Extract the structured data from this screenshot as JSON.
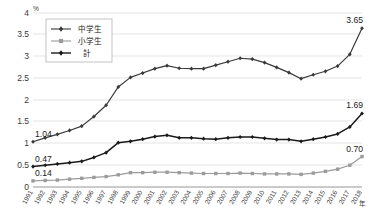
{
  "chart_data": {
    "type": "line",
    "title": "",
    "subtitle": "",
    "xlabel": "年",
    "ylabel": "%",
    "ylim": [
      0,
      4
    ],
    "ytick_values": [
      0,
      0.5,
      1,
      1.5,
      2,
      2.5,
      3,
      3.5,
      4
    ],
    "ytick_labels": [
      "0",
      "0.5",
      "1",
      "1.5",
      "2",
      "2.5",
      "3",
      "3.5",
      "4"
    ],
    "grid": true,
    "legend_position": "top-left",
    "x": [
      1991,
      1992,
      1993,
      1994,
      1995,
      1996,
      1997,
      1998,
      1999,
      2000,
      2001,
      2002,
      2003,
      2004,
      2005,
      2006,
      2007,
      2008,
      2009,
      2010,
      2011,
      2012,
      2013,
      2014,
      2015,
      2016,
      2017,
      2018
    ],
    "categories": [
      "1991",
      "1992",
      "1993",
      "1994",
      "1995",
      "1996",
      "1997",
      "1998",
      "1999",
      "2000",
      "2001",
      "2002",
      "2003",
      "2004",
      "2005",
      "2006",
      "2007",
      "2008",
      "2009",
      "2010",
      "2011",
      "2012",
      "2013",
      "2014",
      "2015",
      "2016",
      "2017",
      "2018"
    ],
    "series": [
      {
        "name": "中学生",
        "color": "#3a3a3a",
        "marker": "diamond",
        "values": [
          1.04,
          1.13,
          1.21,
          1.3,
          1.4,
          1.62,
          1.88,
          2.3,
          2.52,
          2.62,
          2.72,
          2.79,
          2.73,
          2.72,
          2.72,
          2.8,
          2.88,
          2.96,
          2.94,
          2.86,
          2.75,
          2.63,
          2.49,
          2.58,
          2.66,
          2.78,
          3.05,
          3.65
        ],
        "start_label": "1.04",
        "end_label": "3.65"
      },
      {
        "name": "小学生",
        "color": "#9b9b9b",
        "marker": "square",
        "values": [
          0.14,
          0.15,
          0.16,
          0.18,
          0.2,
          0.22,
          0.24,
          0.28,
          0.33,
          0.33,
          0.34,
          0.34,
          0.33,
          0.32,
          0.31,
          0.31,
          0.31,
          0.32,
          0.31,
          0.3,
          0.3,
          0.3,
          0.29,
          0.32,
          0.36,
          0.41,
          0.5,
          0.7
        ],
        "start_label": "0.14",
        "end_label": "0.70"
      },
      {
        "name": "計",
        "color": "#1a1a1a",
        "marker": "diamond",
        "values": [
          0.47,
          0.5,
          0.53,
          0.56,
          0.59,
          0.68,
          0.79,
          1.02,
          1.05,
          1.1,
          1.16,
          1.19,
          1.13,
          1.13,
          1.11,
          1.1,
          1.13,
          1.15,
          1.15,
          1.12,
          1.09,
          1.09,
          1.05,
          1.1,
          1.15,
          1.22,
          1.38,
          1.69
        ],
        "start_label": "0.47",
        "end_label": "1.69"
      }
    ],
    "annotations": [
      {
        "text": "1.04",
        "series": "中学生",
        "x": 1991
      },
      {
        "text": "0.47",
        "series": "計",
        "x": 1991
      },
      {
        "text": "0.14",
        "series": "小学生",
        "x": 1991
      },
      {
        "text": "3.65",
        "series": "中学生",
        "x": 2018
      },
      {
        "text": "1.69",
        "series": "計",
        "x": 2018
      },
      {
        "text": "0.70",
        "series": "小学生",
        "x": 2018
      }
    ]
  },
  "axis": {
    "y_unit": "%",
    "x_unit": "年"
  },
  "legend": {
    "items": [
      {
        "label": "中学生"
      },
      {
        "label": "小学生"
      },
      {
        "label": "計"
      }
    ]
  },
  "caption": {
    "text": ""
  }
}
